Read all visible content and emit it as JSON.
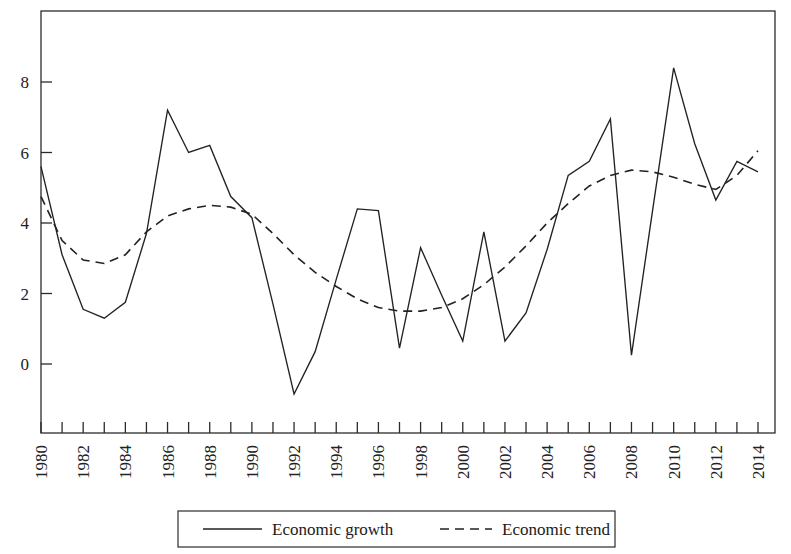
{
  "chart_data": {
    "type": "line",
    "title": "",
    "subtitle": "",
    "xlabel": "",
    "ylabel": "",
    "xlim": [
      1980,
      2014
    ],
    "ylim": [
      -1.6,
      9.6
    ],
    "y_ticks": [
      0,
      2,
      4,
      6,
      8
    ],
    "y_tick_labels": [
      "0",
      "2",
      "4",
      "6",
      "8"
    ],
    "x_ticks": [
      1980,
      1981,
      1982,
      1983,
      1984,
      1985,
      1986,
      1987,
      1988,
      1989,
      1990,
      1991,
      1992,
      1993,
      1994,
      1995,
      1996,
      1997,
      1998,
      1999,
      2000,
      2001,
      2002,
      2003,
      2004,
      2005,
      2006,
      2007,
      2008,
      2009,
      2010,
      2011,
      2012,
      2013,
      2014
    ],
    "x_tick_labels": [
      "1980",
      "",
      "1982",
      "",
      "1984",
      "",
      "1986",
      "",
      "1988",
      "",
      "1990",
      "",
      "1992",
      "",
      "1994",
      "",
      "1996",
      "",
      "1998",
      "",
      "2000",
      "",
      "2002",
      "",
      "2004",
      "",
      "2006",
      "",
      "2008",
      "",
      "2010",
      "",
      "2012",
      "",
      "2014"
    ],
    "x_tick_label_rotation": -90,
    "grid": false,
    "legend_position": "bottom-center",
    "x": [
      1980,
      1981,
      1982,
      1983,
      1984,
      1985,
      1986,
      1987,
      1988,
      1989,
      1990,
      1991,
      1992,
      1993,
      1994,
      1995,
      1996,
      1997,
      1998,
      1999,
      2000,
      2001,
      2002,
      2003,
      2004,
      2005,
      2006,
      2007,
      2008,
      2009,
      2010,
      2011,
      2012,
      2013,
      2014
    ],
    "series": [
      {
        "name": "Economic growth",
        "style": "solid",
        "color": "#222222",
        "values": [
          5.6,
          3.1,
          1.55,
          1.3,
          1.75,
          3.7,
          7.2,
          6.0,
          6.2,
          4.75,
          4.15,
          1.7,
          -0.85,
          0.35,
          2.4,
          4.4,
          4.35,
          0.45,
          3.3,
          1.95,
          0.65,
          3.75,
          0.65,
          1.45,
          3.25,
          5.35,
          5.75,
          6.95,
          0.25,
          4.35,
          8.4,
          6.25,
          4.65,
          5.75,
          5.45
        ]
      },
      {
        "name": "Economic trend",
        "style": "dashed",
        "color": "#222222",
        "values": [
          4.75,
          3.5,
          2.95,
          2.85,
          3.1,
          3.75,
          4.2,
          4.4,
          4.5,
          4.45,
          4.25,
          3.7,
          3.1,
          2.6,
          2.2,
          1.85,
          1.6,
          1.5,
          1.5,
          1.6,
          1.85,
          2.25,
          2.75,
          3.35,
          4.0,
          4.55,
          5.05,
          5.35,
          5.5,
          5.45,
          5.3,
          5.1,
          4.95,
          5.35,
          6.05
        ]
      }
    ],
    "legend": [
      {
        "label": "Economic growth",
        "style": "solid"
      },
      {
        "label": "Economic trend",
        "style": "dashed"
      }
    ]
  },
  "plot": {
    "frame_left": 41,
    "frame_right": 775,
    "frame_top": 11,
    "frame_bottom": 433,
    "x_axis_start": 41,
    "x_axis_end": 758,
    "y_value_0_px": 364,
    "px_per_unit": 35.25
  }
}
